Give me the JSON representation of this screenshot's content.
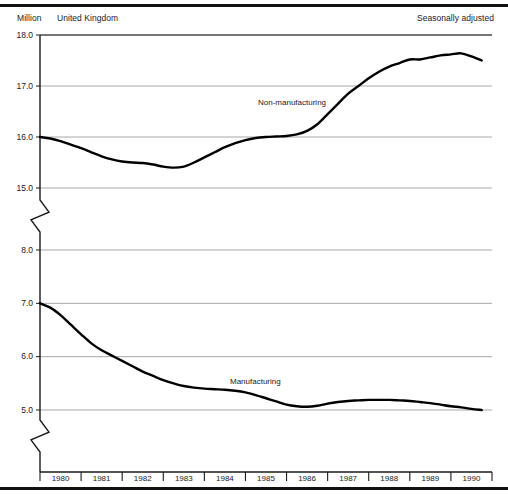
{
  "header": {
    "unit_label": "Million",
    "region_label": "United Kingdom",
    "adjustment_label": "Seasonally adjusted"
  },
  "chart_data": {
    "type": "line",
    "title": "",
    "xlabel": "",
    "ylabel": "Million",
    "grid": true,
    "legend_position": "inline-annotation",
    "panels": [
      {
        "name": "upper",
        "ylabel": "Million",
        "ylim": [
          15.0,
          18.0
        ],
        "yticks": [
          "18.0",
          "17.0",
          "16.0",
          "15.0"
        ],
        "ytick_values": [
          18.0,
          17.0,
          16.0,
          15.0
        ],
        "axis_break_below": true,
        "series": [
          {
            "name": "Non-manufacturing",
            "annotation": "Non-manufacturing",
            "x": [
              1980.0,
              1980.25,
              1980.5,
              1980.75,
              1981.0,
              1981.25,
              1981.5,
              1981.75,
              1982.0,
              1982.25,
              1982.5,
              1982.75,
              1983.0,
              1983.25,
              1983.5,
              1983.75,
              1984.0,
              1984.25,
              1984.5,
              1984.75,
              1985.0,
              1985.25,
              1985.5,
              1985.75,
              1986.0,
              1986.25,
              1986.5,
              1986.75,
              1987.0,
              1987.25,
              1987.5,
              1987.75,
              1988.0,
              1988.25,
              1988.5,
              1988.75,
              1989.0,
              1989.25,
              1989.5,
              1989.75,
              1990.0,
              1990.25,
              1990.5,
              1990.75
            ],
            "values": [
              16.0,
              15.97,
              15.92,
              15.85,
              15.78,
              15.7,
              15.62,
              15.56,
              15.52,
              15.5,
              15.49,
              15.46,
              15.42,
              15.4,
              15.42,
              15.5,
              15.6,
              15.7,
              15.8,
              15.88,
              15.94,
              15.98,
              16.0,
              16.01,
              16.02,
              16.05,
              16.12,
              16.25,
              16.45,
              16.65,
              16.85,
              17.0,
              17.15,
              17.28,
              17.38,
              17.45,
              17.52,
              17.52,
              17.56,
              17.6,
              17.62,
              17.64,
              17.58,
              17.5
            ]
          }
        ]
      },
      {
        "name": "lower",
        "ylim": [
          5.0,
          8.0
        ],
        "yticks": [
          "8.0",
          "7.0",
          "6.0",
          "5.0"
        ],
        "ytick_values": [
          8.0,
          7.0,
          6.0,
          5.0
        ],
        "axis_break_above": true,
        "axis_break_below": true,
        "series": [
          {
            "name": "Manufacturing",
            "annotation": "Manufacturing",
            "x": [
              1980.0,
              1980.25,
              1980.5,
              1980.75,
              1981.0,
              1981.25,
              1981.5,
              1981.75,
              1982.0,
              1982.25,
              1982.5,
              1982.75,
              1983.0,
              1983.25,
              1983.5,
              1983.75,
              1984.0,
              1984.25,
              1984.5,
              1984.75,
              1985.0,
              1985.25,
              1985.5,
              1985.75,
              1986.0,
              1986.25,
              1986.5,
              1986.75,
              1987.0,
              1987.25,
              1987.5,
              1987.75,
              1988.0,
              1988.25,
              1988.5,
              1988.75,
              1989.0,
              1989.25,
              1989.5,
              1989.75,
              1990.0,
              1990.25,
              1990.5,
              1990.75
            ],
            "values": [
              7.0,
              6.92,
              6.78,
              6.6,
              6.42,
              6.25,
              6.12,
              6.02,
              5.92,
              5.82,
              5.72,
              5.64,
              5.56,
              5.5,
              5.45,
              5.42,
              5.4,
              5.39,
              5.38,
              5.36,
              5.33,
              5.28,
              5.22,
              5.16,
              5.1,
              5.07,
              5.06,
              5.08,
              5.12,
              5.15,
              5.17,
              5.18,
              5.19,
              5.19,
              5.19,
              5.18,
              5.17,
              5.15,
              5.13,
              5.1,
              5.07,
              5.05,
              5.02,
              5.0
            ]
          }
        ]
      }
    ],
    "xticks": [
      "1980",
      "1981",
      "1982",
      "1983",
      "1984",
      "1985",
      "1986",
      "1987",
      "1988",
      "1989",
      "1990"
    ],
    "xlim": [
      1980,
      1991
    ]
  },
  "style": {
    "line_color": "#000000",
    "grid_color": "#a8a8a8",
    "axis_color": "#1a1a1a",
    "background": "#ffffff"
  }
}
